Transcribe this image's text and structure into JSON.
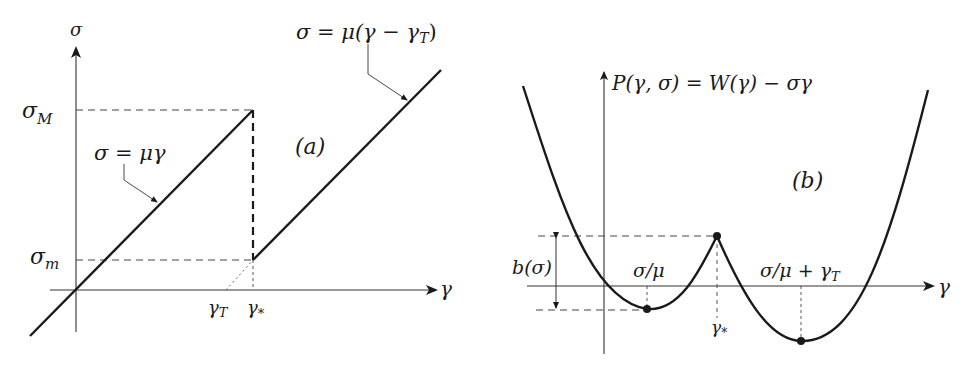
{
  "colors": {
    "ink": "#1a1a1a",
    "axis": "#333333",
    "dash": "#444444",
    "background": "#ffffff"
  },
  "panel_a": {
    "tag": "(a)",
    "y_axis_label": "σ",
    "x_axis_label": "γ",
    "tick_sigma_M": "σ",
    "tick_sigma_M_sub": "M",
    "tick_sigma_m": "σ",
    "tick_sigma_m_sub": "m",
    "tick_gamma_T": "γ",
    "tick_gamma_T_sub": "T",
    "tick_gamma_star": "γ",
    "tick_gamma_star_sub": "*",
    "line1_label": "σ = μγ",
    "line2_label_main": "σ = μ(γ − γ",
    "line2_label_sub": "T",
    "line2_label_close": ")"
  },
  "panel_b": {
    "tag": "(b)",
    "y_axis_label_main": "P(γ, σ) = W(γ) − σγ",
    "x_axis_label": "γ",
    "barrier_label": "b(σ)",
    "min1_label": "σ/μ",
    "min2_label_main": "σ/μ + γ",
    "min2_label_sub": "T",
    "cusp_label": "γ",
    "cusp_label_sub": "*"
  }
}
